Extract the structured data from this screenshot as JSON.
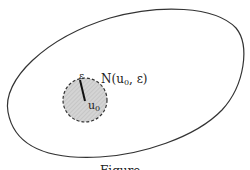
{
  "diagram": {
    "labels": {
      "epsilon": "ε",
      "neighborhood": "N(u",
      "neighborhood_sub": "0",
      "neighborhood_tail": ", ε)",
      "center": "u",
      "center_sub": "0"
    },
    "caption": "Figure"
  },
  "colors": {
    "outline": "#333333",
    "disk_fill": "#cfcfcf",
    "disk_border": "#333333",
    "background": "#ffffff"
  }
}
